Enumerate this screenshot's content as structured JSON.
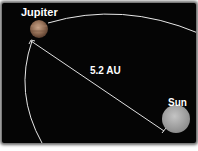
{
  "diagram": {
    "labels": {
      "jupiter": "Jupiter",
      "sun": "Sun",
      "distance": "5.2 AU"
    },
    "colors": {
      "background": "#050505",
      "orbit": "#e8e8e8",
      "jupiter": "#9c7a62",
      "sun": "#b0b0b0",
      "text": "#ffffff"
    }
  }
}
